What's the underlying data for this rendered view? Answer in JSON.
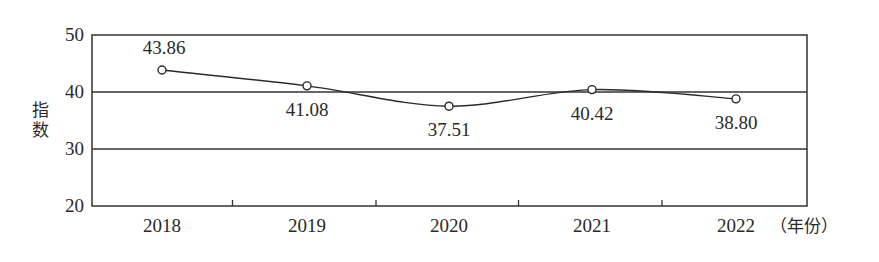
{
  "chart_data": {
    "type": "line",
    "title": "",
    "xlabel": "（年份）",
    "ylabel": "指数",
    "categories": [
      "2018",
      "2019",
      "2020",
      "2021",
      "2022"
    ],
    "series": [
      {
        "name": "指数",
        "values": [
          43.86,
          41.08,
          37.51,
          40.42,
          38.8
        ],
        "labels": [
          "43.86",
          "41.08",
          "37.51",
          "40.42",
          "38.80"
        ],
        "smooth": true,
        "marker": "open-circle"
      }
    ],
    "ylim": [
      20,
      50
    ],
    "yticks": [
      20,
      30,
      40,
      50
    ],
    "grid": {
      "horizontal": [
        30,
        40
      ],
      "vertical": false
    },
    "legend": null,
    "colors": {
      "line": "#2a2a2a",
      "axis": "#333333",
      "text": "#2a2a2a",
      "background": "#ffffff"
    }
  }
}
